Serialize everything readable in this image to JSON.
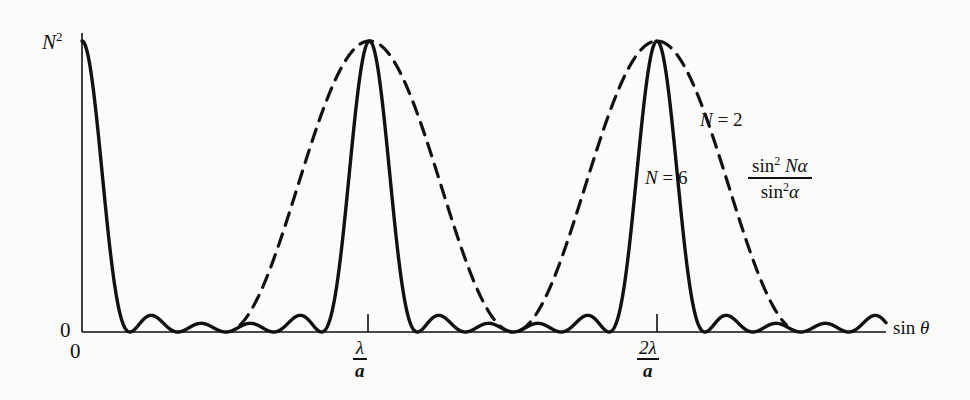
{
  "figure": {
    "background_color": "#fbfbf9",
    "ink_color": "#111111"
  },
  "axes": {
    "y_max_label": "N",
    "y_max_superscript": "2",
    "y_zero_label": "0",
    "x_zero_label": "0",
    "x_axis_name_prefix": "sin ",
    "x_axis_name_symbol": "θ",
    "ticks": [
      {
        "numerator": "λ",
        "denominator": "a"
      },
      {
        "numerator": "2λ",
        "denominator": "a"
      }
    ]
  },
  "annotations": {
    "curve_n2_label": "N",
    "curve_n2_value": " = 2",
    "curve_n6_label": "N",
    "curve_n6_value": " = 6",
    "formula_numerator_sin": "sin",
    "formula_numerator_exp": "2",
    "formula_numerator_arg": "Nα",
    "formula_denominator_sin": "sin",
    "formula_denominator_exp": "2",
    "formula_denominator_arg": "α"
  },
  "chart_data": {
    "type": "line",
    "title": "",
    "xlabel": "sin θ",
    "ylabel": "",
    "xlim": [
      0,
      2.72
    ],
    "ylim": [
      0,
      1
    ],
    "grid": false,
    "legend_position": "inside-right",
    "x_tick_values": [
      0,
      1,
      2
    ],
    "x_tick_labels": [
      "0",
      "λ/a",
      "2λ/a"
    ],
    "y_tick_values": [
      0,
      1
    ],
    "y_tick_labels": [
      "0",
      "N²"
    ],
    "function": "sin^2(N*alpha)/sin^2(alpha)",
    "normalization": "peak value N^2 mapped to 1",
    "series": [
      {
        "name": "N = 6",
        "style": "solid",
        "color": "#111111",
        "line_width": 3,
        "N": 6,
        "principal_maxima_x": [
          0,
          1,
          2
        ],
        "principal_maxima_y": [
          1,
          1,
          1
        ],
        "secondary_maxima_count_between_principals": 4,
        "secondary_maxima_relative_height": 0.05,
        "half_width_in_x": 0.167
      },
      {
        "name": "N = 2",
        "style": "dashed",
        "color": "#111111",
        "line_width": 3,
        "N": 2,
        "principal_maxima_x": [
          0,
          1,
          2
        ],
        "principal_maxima_y": [
          1,
          1,
          1
        ],
        "secondary_maxima_count_between_principals": 0,
        "half_width_in_x": 0.5,
        "drawn_range_x": [
          0.55,
          2.45
        ]
      }
    ],
    "annotations": [
      {
        "text": "N = 2",
        "x": 2.33,
        "y": 0.75
      },
      {
        "text": "N = 6",
        "x": 2.14,
        "y": 0.56
      },
      {
        "text": "sin² Nα / sin²α",
        "x": 2.5,
        "y": 0.6
      }
    ]
  }
}
